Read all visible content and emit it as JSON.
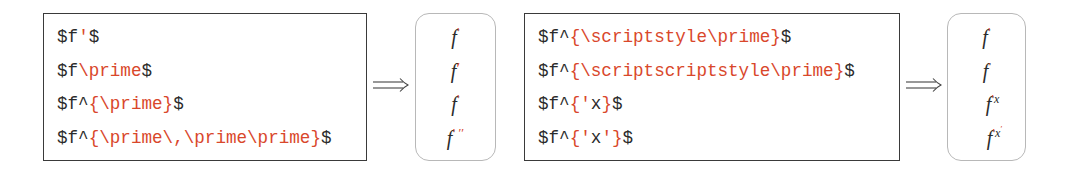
{
  "colors": {
    "code_text": "#2b2b2b",
    "highlight": "#d9472b",
    "code_box_border": "#3a3a3a",
    "output_box_border": "#b8b8b8"
  },
  "panel_left": {
    "code_lines": [
      {
        "segments": [
          {
            "text": "$f",
            "hl": false
          },
          {
            "text": "'",
            "hl": true
          },
          {
            "text": "$",
            "hl": false
          }
        ]
      },
      {
        "segments": [
          {
            "text": "$f",
            "hl": false
          },
          {
            "text": "\\prime",
            "hl": true
          },
          {
            "text": "$",
            "hl": false
          }
        ]
      },
      {
        "segments": [
          {
            "text": "$f^",
            "hl": false
          },
          {
            "text": "{\\prime}",
            "hl": true
          },
          {
            "text": "$",
            "hl": false
          }
        ]
      },
      {
        "segments": [
          {
            "text": "$f^",
            "hl": false
          },
          {
            "text": "{\\prime\\,\\prime\\prime}",
            "hl": true
          },
          {
            "text": "$",
            "hl": false
          }
        ]
      }
    ],
    "arrow": "⟹",
    "outputs": [
      {
        "base": "f",
        "sup": "′"
      },
      {
        "base": "f",
        "sup": "′"
      },
      {
        "base": "f",
        "sup": "′"
      },
      {
        "base": "f",
        "sup": "′ ′′"
      }
    ]
  },
  "panel_right": {
    "code_lines": [
      {
        "segments": [
          {
            "text": "$f^",
            "hl": false
          },
          {
            "text": "{\\scriptstyle\\prime}",
            "hl": true
          },
          {
            "text": "$",
            "hl": false
          }
        ]
      },
      {
        "segments": [
          {
            "text": "$f^",
            "hl": false
          },
          {
            "text": "{\\scriptscriptstyle\\prime}",
            "hl": true
          },
          {
            "text": "$",
            "hl": false
          }
        ]
      },
      {
        "segments": [
          {
            "text": "$f^",
            "hl": false
          },
          {
            "text": "{'",
            "hl": true
          },
          {
            "text": "x",
            "hl": false
          },
          {
            "text": "}",
            "hl": true
          },
          {
            "text": "$",
            "hl": false
          }
        ]
      },
      {
        "segments": [
          {
            "text": "$f^",
            "hl": false
          },
          {
            "text": "{'",
            "hl": true
          },
          {
            "text": "x",
            "hl": false
          },
          {
            "text": "'}",
            "hl": true
          },
          {
            "text": "$",
            "hl": false
          }
        ]
      }
    ],
    "arrow": "⟹",
    "outputs": [
      {
        "base": "f",
        "sup": "′"
      },
      {
        "base": "f",
        "sup": "′"
      },
      {
        "base": "f",
        "sup": "′",
        "after": "x"
      },
      {
        "base": "f",
        "sup": "′",
        "after": "x",
        "after_sup": "′"
      }
    ]
  }
}
